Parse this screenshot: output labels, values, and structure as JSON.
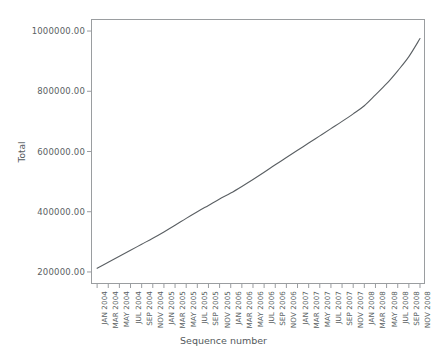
{
  "chart_data": {
    "type": "line",
    "title": "",
    "xlabel": "Sequence number",
    "ylabel": "Total",
    "grid": false,
    "legend": false,
    "ylim": [
      160000,
      1040000
    ],
    "ytick_labels": [
      "200000.00",
      "400000.00",
      "600000.00",
      "800000.00",
      "1000000.00"
    ],
    "ytick_values": [
      200000,
      400000,
      600000,
      800000,
      1000000
    ],
    "categories": [
      "JAN 2004",
      "MAR 2004",
      "MAY 2004",
      "JUL 2004",
      "SEP 2004",
      "NOV 2004",
      "JAN 2005",
      "MAR 2005",
      "MAY 2005",
      "JUL 2005",
      "SEP 2005",
      "NOV 2005",
      "JAN 2006",
      "MAR 2006",
      "MAY 2006",
      "JUL 2006",
      "SEP 2006",
      "NOV 2006",
      "JAN 2007",
      "MAR 2007",
      "MAY 2007",
      "JUL 2007",
      "SEP 2007",
      "NOV 2007",
      "JAN 2008",
      "MAR 2008",
      "MAY 2008",
      "JUL 2008",
      "SEP 2008",
      "NOV 2008"
    ],
    "values": [
      212000,
      232000,
      252000,
      272000,
      292000,
      312000,
      333000,
      355000,
      378000,
      400000,
      421000,
      442000,
      462000,
      484000,
      507000,
      531000,
      556000,
      580000,
      604000,
      628000,
      652000,
      676000,
      700000,
      725000,
      752000,
      788000,
      825000,
      868000,
      915000,
      975000
    ],
    "line_color": "#5a5f63",
    "frame_color": "#9a9da0",
    "background": "#ffffff"
  }
}
